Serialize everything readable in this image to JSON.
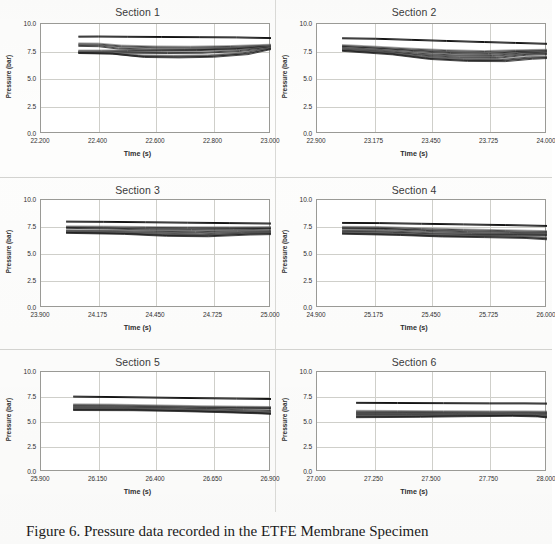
{
  "figure": {
    "caption": "Figure 6. Pressure data recorded in the ETFE Membrane Specimen",
    "axis_titles": {
      "x": "Time (s)",
      "y": "Pressure (bar)"
    },
    "y_axis": {
      "ticks": [
        "10.0",
        "7.5",
        "5.0",
        "2.5",
        "0.0"
      ],
      "min": 0.0,
      "max": 10.0,
      "step": 2.5
    }
  },
  "chart_data": [
    {
      "type": "line",
      "title": "Section 1",
      "xlabel": "Time (s)",
      "ylabel": "Pressure (bar)",
      "xlim": [
        22.2,
        23.0
      ],
      "ylim": [
        0.0,
        10.0
      ],
      "xticks": [
        "22.200",
        "22.400",
        "22.600",
        "22.800",
        "23.000"
      ],
      "yticks": [
        "0.0",
        "2.5",
        "5.0",
        "7.5",
        "10.0"
      ],
      "grid": true,
      "legend": "none",
      "series": [
        {
          "name": "trace-1",
          "x": [
            22.33,
            22.4,
            22.5,
            22.62,
            22.75,
            22.88,
            23.0
          ],
          "values": [
            8.85,
            8.86,
            8.84,
            8.82,
            8.8,
            8.78,
            8.72
          ]
        },
        {
          "name": "trace-2",
          "x": [
            22.33,
            22.4,
            22.48,
            22.6,
            22.72,
            22.86,
            23.0
          ],
          "values": [
            8.2,
            8.18,
            8.0,
            7.92,
            7.9,
            7.96,
            8.08
          ]
        },
        {
          "name": "trace-3",
          "x": [
            22.33,
            22.4,
            22.47,
            22.58,
            22.7,
            22.85,
            23.0
          ],
          "values": [
            8.05,
            8.02,
            7.8,
            7.72,
            7.7,
            7.8,
            8.02
          ]
        },
        {
          "name": "trace-4",
          "x": [
            22.33,
            22.41,
            22.5,
            22.62,
            22.74,
            22.88,
            23.0
          ],
          "values": [
            7.55,
            7.55,
            7.58,
            7.62,
            7.66,
            7.76,
            7.98
          ]
        },
        {
          "name": "trace-5",
          "x": [
            22.33,
            22.42,
            22.52,
            22.64,
            22.76,
            22.89,
            23.0
          ],
          "values": [
            7.48,
            7.46,
            7.42,
            7.4,
            7.42,
            7.58,
            7.9
          ]
        },
        {
          "name": "trace-6",
          "x": [
            22.33,
            22.44,
            22.54,
            22.66,
            22.78,
            22.9,
            23.0
          ],
          "values": [
            7.42,
            7.38,
            7.12,
            7.08,
            7.12,
            7.36,
            7.82
          ]
        },
        {
          "name": "trace-7",
          "x": [
            22.33,
            22.45,
            22.56,
            22.68,
            22.8,
            22.92,
            23.0
          ],
          "values": [
            7.4,
            7.34,
            7.04,
            7.0,
            7.06,
            7.3,
            7.76
          ]
        }
      ]
    },
    {
      "type": "line",
      "title": "Section 2",
      "xlabel": "Time (s)",
      "ylabel": "Pressure (bar)",
      "xlim": [
        22.9,
        24.0
      ],
      "ylim": [
        0.0,
        10.0
      ],
      "xticks": [
        "22.900",
        "23.175",
        "23.450",
        "23.725",
        "24.000"
      ],
      "yticks": [
        "0.0",
        "2.5",
        "5.0",
        "7.5",
        "10.0"
      ],
      "grid": true,
      "legend": "none",
      "series": [
        {
          "name": "trace-1",
          "x": [
            23.02,
            23.18,
            23.35,
            23.52,
            23.7,
            23.85,
            24.0
          ],
          "values": [
            8.7,
            8.66,
            8.56,
            8.46,
            8.36,
            8.28,
            8.2
          ]
        },
        {
          "name": "trace-2",
          "x": [
            23.02,
            23.18,
            23.35,
            23.52,
            23.7,
            23.85,
            24.0
          ],
          "values": [
            8.05,
            7.9,
            7.72,
            7.58,
            7.5,
            7.58,
            7.62
          ]
        },
        {
          "name": "trace-3",
          "x": [
            23.02,
            23.18,
            23.36,
            23.54,
            23.72,
            23.86,
            24.0
          ],
          "values": [
            7.95,
            7.8,
            7.58,
            7.4,
            7.32,
            7.48,
            7.56
          ]
        },
        {
          "name": "trace-4",
          "x": [
            23.02,
            23.2,
            23.38,
            23.56,
            23.74,
            23.88,
            24.0
          ],
          "values": [
            7.8,
            7.62,
            7.34,
            7.18,
            7.14,
            7.36,
            7.44
          ]
        },
        {
          "name": "trace-5",
          "x": [
            23.02,
            23.22,
            23.4,
            23.58,
            23.76,
            23.9,
            24.0
          ],
          "values": [
            7.72,
            7.5,
            7.16,
            6.98,
            6.96,
            7.24,
            7.3
          ]
        },
        {
          "name": "trace-6",
          "x": [
            23.02,
            23.24,
            23.42,
            23.6,
            23.78,
            23.92,
            24.0
          ],
          "values": [
            7.66,
            7.38,
            6.96,
            6.78,
            6.76,
            7.0,
            7.02
          ]
        },
        {
          "name": "trace-7",
          "x": [
            23.02,
            23.26,
            23.44,
            23.62,
            23.8,
            23.93,
            24.0
          ],
          "values": [
            7.6,
            7.28,
            6.86,
            6.68,
            6.66,
            6.88,
            6.94
          ]
        }
      ]
    },
    {
      "type": "line",
      "title": "Section 3",
      "xlabel": "Time (s)",
      "ylabel": "Pressure (bar)",
      "xlim": [
        23.9,
        25.0
      ],
      "ylim": [
        0.0,
        10.0
      ],
      "xticks": [
        "23.900",
        "24.175",
        "24.450",
        "24.725",
        "25.000"
      ],
      "yticks": [
        "0.0",
        "2.5",
        "5.0",
        "7.5",
        "10.0"
      ],
      "grid": true,
      "legend": "none",
      "series": [
        {
          "name": "trace-1",
          "x": [
            24.02,
            24.2,
            24.4,
            24.6,
            24.8,
            25.0
          ],
          "values": [
            8.0,
            7.98,
            7.94,
            7.9,
            7.86,
            7.82
          ]
        },
        {
          "name": "trace-2",
          "x": [
            24.02,
            24.2,
            24.4,
            24.6,
            24.8,
            25.0
          ],
          "values": [
            7.52,
            7.5,
            7.46,
            7.44,
            7.44,
            7.46
          ]
        },
        {
          "name": "trace-3",
          "x": [
            24.02,
            24.22,
            24.42,
            24.62,
            24.82,
            25.0
          ],
          "values": [
            7.46,
            7.4,
            7.3,
            7.28,
            7.32,
            7.38
          ]
        },
        {
          "name": "trace-4",
          "x": [
            24.02,
            24.24,
            24.44,
            24.64,
            24.84,
            25.0
          ],
          "values": [
            7.18,
            7.16,
            7.1,
            7.06,
            7.14,
            7.16
          ]
        },
        {
          "name": "trace-5",
          "x": [
            24.02,
            24.26,
            24.46,
            24.66,
            24.86,
            25.0
          ],
          "values": [
            7.1,
            7.04,
            6.92,
            6.86,
            7.0,
            7.04
          ]
        },
        {
          "name": "trace-6",
          "x": [
            24.02,
            24.28,
            24.48,
            24.68,
            24.88,
            25.0
          ],
          "values": [
            7.04,
            6.96,
            6.8,
            6.74,
            6.92,
            6.96
          ]
        },
        {
          "name": "trace-7",
          "x": [
            24.02,
            24.3,
            24.5,
            24.7,
            24.9,
            25.0
          ],
          "values": [
            7.0,
            6.9,
            6.72,
            6.68,
            6.84,
            6.88
          ]
        }
      ]
    },
    {
      "type": "line",
      "title": "Section 4",
      "xlabel": "Time (s)",
      "ylabel": "Pressure (bar)",
      "xlim": [
        24.9,
        26.0
      ],
      "ylim": [
        0.0,
        10.0
      ],
      "xticks": [
        "24.900",
        "25.175",
        "25.450",
        "25.725",
        "26.000"
      ],
      "yticks": [
        "0.0",
        "2.5",
        "5.0",
        "7.5",
        "10.0"
      ],
      "grid": true,
      "legend": "none",
      "series": [
        {
          "name": "trace-1",
          "x": [
            25.02,
            25.2,
            25.4,
            25.6,
            25.8,
            26.0
          ],
          "values": [
            7.88,
            7.86,
            7.8,
            7.74,
            7.68,
            7.6
          ]
        },
        {
          "name": "trace-2",
          "x": [
            25.02,
            25.2,
            25.4,
            25.6,
            25.8,
            26.0
          ],
          "values": [
            7.48,
            7.46,
            7.34,
            7.24,
            7.16,
            7.08
          ]
        },
        {
          "name": "trace-3",
          "x": [
            25.02,
            25.22,
            25.42,
            25.62,
            25.82,
            26.0
          ],
          "values": [
            7.4,
            7.36,
            7.18,
            7.06,
            7.0,
            6.94
          ]
        },
        {
          "name": "trace-4",
          "x": [
            25.02,
            25.24,
            25.44,
            25.64,
            25.84,
            26.0
          ],
          "values": [
            7.18,
            7.14,
            6.96,
            6.9,
            6.86,
            6.84
          ]
        },
        {
          "name": "trace-5",
          "x": [
            25.02,
            25.26,
            25.46,
            25.66,
            25.86,
            26.0
          ],
          "values": [
            7.06,
            7.0,
            6.84,
            6.8,
            6.78,
            6.76
          ]
        },
        {
          "name": "trace-6",
          "x": [
            25.02,
            25.28,
            25.48,
            25.68,
            25.88,
            26.0
          ],
          "values": [
            6.96,
            6.86,
            6.72,
            6.68,
            6.62,
            6.5
          ]
        },
        {
          "name": "trace-7",
          "x": [
            25.02,
            25.3,
            25.5,
            25.7,
            25.9,
            26.0
          ],
          "values": [
            6.92,
            6.8,
            6.66,
            6.6,
            6.52,
            6.4
          ]
        }
      ]
    },
    {
      "type": "line",
      "title": "Section 5",
      "xlabel": "Time (s)",
      "ylabel": "Pressure (bar)",
      "xlim": [
        25.9,
        26.9
      ],
      "ylim": [
        0.0,
        10.0
      ],
      "xticks": [
        "25.900",
        "26.150",
        "26.400",
        "26.650",
        "26.900"
      ],
      "yticks": [
        "0.0",
        "2.5",
        "5.0",
        "7.5",
        "10.0"
      ],
      "grid": true,
      "legend": "none",
      "series": [
        {
          "name": "trace-1",
          "x": [
            26.04,
            26.2,
            26.4,
            26.6,
            26.75,
            26.9
          ],
          "values": [
            7.54,
            7.5,
            7.44,
            7.38,
            7.34,
            7.3
          ]
        },
        {
          "name": "trace-2",
          "x": [
            26.04,
            26.2,
            26.4,
            26.6,
            26.75,
            26.9
          ],
          "values": [
            6.72,
            6.7,
            6.62,
            6.54,
            6.5,
            6.46
          ]
        },
        {
          "name": "trace-3",
          "x": [
            26.04,
            26.22,
            26.42,
            26.62,
            26.78,
            26.9
          ],
          "values": [
            6.6,
            6.58,
            6.52,
            6.44,
            6.42,
            6.4
          ]
        },
        {
          "name": "trace-4",
          "x": [
            26.04,
            26.24,
            26.44,
            26.64,
            26.78,
            26.9
          ],
          "values": [
            6.48,
            6.46,
            6.4,
            6.3,
            6.22,
            6.14
          ]
        },
        {
          "name": "trace-5",
          "x": [
            26.04,
            26.26,
            26.46,
            26.66,
            26.8,
            26.9
          ],
          "values": [
            6.38,
            6.36,
            6.28,
            6.16,
            6.06,
            5.98
          ]
        },
        {
          "name": "trace-6",
          "x": [
            26.04,
            26.28,
            26.48,
            26.68,
            26.82,
            26.9
          ],
          "values": [
            6.3,
            6.28,
            6.2,
            6.08,
            5.98,
            5.9
          ]
        },
        {
          "name": "trace-7",
          "x": [
            26.04,
            26.3,
            26.5,
            26.7,
            26.84,
            26.9
          ],
          "values": [
            6.24,
            6.22,
            6.14,
            6.02,
            5.92,
            5.86
          ]
        }
      ]
    },
    {
      "type": "line",
      "title": "Section 6",
      "xlabel": "Time (s)",
      "ylabel": "Pressure (bar)",
      "xlim": [
        27.0,
        28.0
      ],
      "ylim": [
        0.0,
        10.0
      ],
      "xticks": [
        "27.000",
        "27.250",
        "27.500",
        "27.750",
        "28.000"
      ],
      "yticks": [
        "0.0",
        "2.5",
        "5.0",
        "7.5",
        "10.0"
      ],
      "grid": true,
      "legend": "none",
      "series": [
        {
          "name": "trace-1",
          "x": [
            27.17,
            27.35,
            27.55,
            27.75,
            27.9,
            28.0
          ],
          "values": [
            6.92,
            6.9,
            6.88,
            6.86,
            6.86,
            6.84
          ]
        },
        {
          "name": "trace-2",
          "x": [
            27.17,
            27.35,
            27.55,
            27.75,
            27.9,
            28.0
          ],
          "values": [
            6.08,
            6.06,
            6.04,
            6.02,
            6.02,
            6.0
          ]
        },
        {
          "name": "trace-3",
          "x": [
            27.17,
            27.37,
            27.57,
            27.77,
            27.92,
            28.0
          ],
          "values": [
            5.96,
            5.96,
            5.94,
            5.92,
            5.92,
            5.9
          ]
        },
        {
          "name": "trace-4",
          "x": [
            27.17,
            27.39,
            27.59,
            27.79,
            27.93,
            28.0
          ],
          "values": [
            5.82,
            5.82,
            5.84,
            5.84,
            5.82,
            5.78
          ]
        },
        {
          "name": "trace-5",
          "x": [
            27.17,
            27.41,
            27.61,
            27.81,
            27.94,
            28.0
          ],
          "values": [
            5.7,
            5.72,
            5.76,
            5.78,
            5.74,
            5.66
          ]
        },
        {
          "name": "trace-6",
          "x": [
            27.17,
            27.43,
            27.63,
            27.83,
            27.95,
            28.0
          ],
          "values": [
            5.58,
            5.62,
            5.68,
            5.72,
            5.66,
            5.56
          ]
        },
        {
          "name": "trace-7",
          "x": [
            27.17,
            27.45,
            27.65,
            27.85,
            27.96,
            28.0
          ],
          "values": [
            5.52,
            5.56,
            5.62,
            5.66,
            5.6,
            5.5
          ]
        }
      ]
    }
  ]
}
